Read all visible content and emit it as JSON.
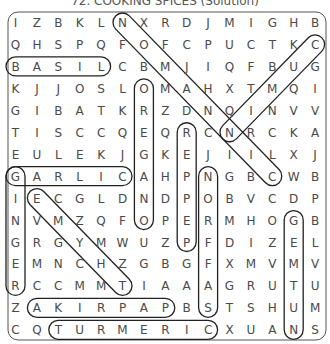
{
  "title": "72. COOKING SPICES (Solution)",
  "grid": [
    [
      "I",
      "Z",
      "B",
      "K",
      "L",
      "N",
      "X",
      "R",
      "D",
      "J",
      "M",
      "I",
      "G",
      "H",
      "B"
    ],
    [
      "Q",
      "H",
      "S",
      "P",
      "Q",
      "F",
      "O",
      "F",
      "C",
      "P",
      "U",
      "C",
      "T",
      "K",
      "C"
    ],
    [
      "B",
      "A",
      "S",
      "I",
      "L",
      "C",
      "B",
      "M",
      "J",
      "I",
      "Q",
      "F",
      "B",
      "U",
      "G"
    ],
    [
      "K",
      "J",
      "J",
      "O",
      "S",
      "L",
      "O",
      "M",
      "A",
      "H",
      "X",
      "T",
      "M",
      "Q",
      "I"
    ],
    [
      "G",
      "I",
      "B",
      "A",
      "T",
      "K",
      "R",
      "Z",
      "D",
      "N",
      "Q",
      "I",
      "N",
      "V",
      "V"
    ],
    [
      "T",
      "I",
      "S",
      "C",
      "C",
      "Q",
      "E",
      "Q",
      "R",
      "C",
      "N",
      "R",
      "C",
      "K",
      "A"
    ],
    [
      "E",
      "U",
      "L",
      "E",
      "K",
      "J",
      "G",
      "K",
      "E",
      "J",
      "I",
      "I",
      "L",
      "X",
      "J"
    ],
    [
      "G",
      "A",
      "R",
      "L",
      "I",
      "C",
      "A",
      "H",
      "P",
      "N",
      "G",
      "B",
      "C",
      "W",
      "B"
    ],
    [
      "I",
      "E",
      "C",
      "G",
      "L",
      "D",
      "N",
      "D",
      "P",
      "O",
      "B",
      "V",
      "C",
      "D",
      "P"
    ],
    [
      "N",
      "V",
      "M",
      "Z",
      "Q",
      "F",
      "O",
      "P",
      "E",
      "R",
      "M",
      "H",
      "O",
      "G",
      "B"
    ],
    [
      "G",
      "R",
      "G",
      "Y",
      "M",
      "W",
      "U",
      "Z",
      "P",
      "F",
      "D",
      "I",
      "Z",
      "E",
      "L"
    ],
    [
      "E",
      "M",
      "N",
      "C",
      "H",
      "Z",
      "G",
      "B",
      "G",
      "F",
      "X",
      "M",
      "V",
      "M",
      "V"
    ],
    [
      "R",
      "C",
      "C",
      "M",
      "M",
      "T",
      "I",
      "A",
      "A",
      "A",
      "G",
      "R",
      "U",
      "T",
      "U"
    ],
    [
      "Z",
      "A",
      "K",
      "I",
      "R",
      "P",
      "A",
      "P",
      "B",
      "S",
      "T",
      "S",
      "H",
      "U",
      "M"
    ],
    [
      "C",
      "Q",
      "T",
      "U",
      "R",
      "M",
      "E",
      "R",
      "I",
      "C",
      "X",
      "U",
      "A",
      "N",
      "S"
    ]
  ],
  "solutions": [
    {
      "word": "BASIL",
      "start": [
        2,
        0
      ],
      "end": [
        2,
        4
      ]
    },
    {
      "word": "CINNAMON",
      "start": [
        7,
        12
      ],
      "end": [
        0,
        5
      ]
    },
    {
      "word": "CUMIN",
      "start": [
        1,
        14
      ],
      "end": [
        5,
        10
      ]
    },
    {
      "word": "OREGANO",
      "start": [
        3,
        6
      ],
      "end": [
        9,
        6
      ]
    },
    {
      "word": "PEPPER",
      "start": [
        10,
        8
      ],
      "end": [
        5,
        8
      ]
    },
    {
      "word": "GARLIC",
      "start": [
        7,
        0
      ],
      "end": [
        7,
        5
      ]
    },
    {
      "word": "GINGER",
      "start": [
        7,
        0
      ],
      "end": [
        12,
        0
      ]
    },
    {
      "word": "SAFFRON",
      "start": [
        13,
        9
      ],
      "end": [
        7,
        9
      ]
    },
    {
      "word": "THYME",
      "start": [
        12,
        5
      ],
      "end": [
        8,
        1
      ]
    },
    {
      "word": "NUTMEG",
      "start": [
        14,
        13
      ],
      "end": [
        9,
        13
      ]
    },
    {
      "word": "PAPRIKA",
      "start": [
        13,
        7
      ],
      "end": [
        13,
        1
      ]
    },
    {
      "word": "TURMERIC",
      "start": [
        14,
        2
      ],
      "end": [
        14,
        9
      ]
    }
  ],
  "colors": {
    "letter": "#4a4a4a",
    "outline": "#222222",
    "border": "#555555"
  }
}
